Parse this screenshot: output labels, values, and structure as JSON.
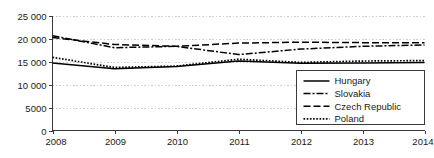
{
  "chart_data": {
    "type": "line",
    "title": "",
    "subtitle": "",
    "xlabel": "",
    "ylabel": "",
    "x": [
      2008,
      2009,
      2010,
      2011,
      2012,
      2013,
      2014
    ],
    "categories": [
      "2008",
      "2009",
      "2010",
      "2011",
      "2012",
      "2013",
      "2014"
    ],
    "xlim": [
      2008,
      2014
    ],
    "ylim": [
      0,
      25000
    ],
    "grid": true,
    "grid_axis": "y",
    "grid_style": "dotted",
    "legend_position": "bottom-right",
    "y_ticks": [
      0,
      5000,
      10000,
      15000,
      20000,
      25000
    ],
    "y_tick_labels": [
      "0",
      "5000",
      "10 000",
      "15 000",
      "20 000",
      "25 000"
    ],
    "x_ticks": [
      2008,
      2009,
      2010,
      2011,
      2012,
      2013,
      2014
    ],
    "x_tick_labels": [
      "2008",
      "2009",
      "2010",
      "2011",
      "2012",
      "2013",
      "2014"
    ],
    "series": [
      {
        "name": "Hungary",
        "style": "solid",
        "dash": "none",
        "color": "#000000",
        "values": [
          14700,
          13400,
          13900,
          15100,
          14600,
          14700,
          14800
        ]
      },
      {
        "name": "Slovakia",
        "style": "dash-dot",
        "dash": "7,2,2,2",
        "color": "#000000",
        "values": [
          20600,
          18000,
          18300,
          16500,
          17700,
          18300,
          18600
        ]
      },
      {
        "name": "Czech Republic",
        "style": "dashed",
        "dash": "7,3",
        "color": "#000000",
        "values": [
          20200,
          18700,
          18300,
          19000,
          19200,
          19100,
          19100
        ]
      },
      {
        "name": "Poland",
        "style": "dotted",
        "dash": "1.6,1.6",
        "color": "#000000",
        "values": [
          15900,
          13700,
          14000,
          15500,
          14800,
          15100,
          15200
        ]
      }
    ]
  },
  "legend": {
    "entries": [
      {
        "label": "Hungary"
      },
      {
        "label": "Slovakia"
      },
      {
        "label": "Czech Republic"
      },
      {
        "label": "Poland"
      }
    ]
  },
  "colors": {
    "line": "#000000",
    "axis": "#3a3a3a",
    "grid": "#cfcfcf",
    "text": "#1a1a1a",
    "background": "#ffffff",
    "legend_border": "#3a3a3a"
  }
}
